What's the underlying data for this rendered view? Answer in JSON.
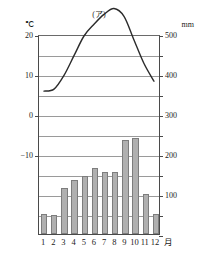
{
  "figure": {
    "marker": "(ア)"
  },
  "axes": {
    "left_unit": "℃",
    "right_unit": "mm",
    "left_ticks": [
      "40",
      "30",
      "20",
      "10",
      "0",
      "-10"
    ],
    "right_ticks": [
      "500",
      "400",
      "300",
      "200",
      "100"
    ],
    "x_unit": "月"
  },
  "chart_data": {
    "type": "bar",
    "title": "(ア)",
    "subtitle": "",
    "xlabel": "月",
    "ylabel": "℃",
    "y2label": "mm",
    "categories": [
      "1",
      "2",
      "3",
      "4",
      "5",
      "6",
      "7",
      "8",
      "9",
      "10",
      "11",
      "12"
    ],
    "grid": true,
    "legend": "none",
    "ylim": [
      -10,
      40
    ],
    "y2lim": [
      0,
      500
    ],
    "y_tick_step": 10,
    "y2_tick_step": 50,
    "y2_label_step": 100,
    "series": [
      {
        "name": "降水量",
        "type": "bar",
        "axis": "right",
        "unit": "mm",
        "values": [
          50,
          48,
          115,
          135,
          145,
          165,
          155,
          155,
          235,
          240,
          100,
          50
        ]
      },
      {
        "name": "気温",
        "type": "line",
        "axis": "left",
        "unit": "℃",
        "values": [
          6,
          6.5,
          10,
          15,
          20,
          23,
          25.5,
          27,
          25,
          19,
          13,
          8.5
        ]
      }
    ]
  },
  "style": {
    "bar_fill": "#b0b0b0",
    "bar_stroke": "#7d7d7d",
    "line_color": "#2b2b2b",
    "grid_color": "#9a9a9a",
    "axis_color": "#4a4a4a"
  }
}
